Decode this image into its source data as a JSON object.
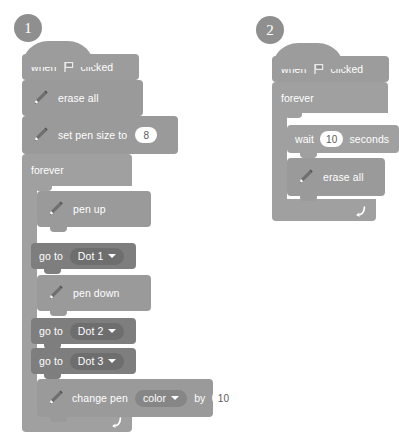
{
  "palette": {
    "events_block": "#9c9c9c",
    "control_block": "#a0a0a0",
    "pen_block": "#9a9a9a",
    "motion_block": "#7e7e7e",
    "dropdown_fill": "#6e6e6e",
    "input_fill": "#ffffff",
    "input_text": "#5a5a5a",
    "badge_fill": "#8f8f8f",
    "text": "#ffffff",
    "background": "#ffffff"
  },
  "scripts": [
    {
      "badge": "1",
      "blocks": {
        "when_flag_clicked": {
          "pre": "when",
          "icon": "green-flag-icon",
          "post": "clicked"
        },
        "erase_all": {
          "icon": "pen-icon",
          "label": "erase all"
        },
        "set_pen_size": {
          "icon": "pen-icon",
          "label": "set pen size to",
          "value": "8"
        },
        "forever": {
          "label": "forever",
          "icon": "loop-arrow-icon"
        },
        "pen_up": {
          "icon": "pen-icon",
          "label": "pen up"
        },
        "go_to_dot1": {
          "label": "go to",
          "dropdown": "Dot 1"
        },
        "pen_down": {
          "icon": "pen-icon",
          "label": "pen down"
        },
        "go_to_dot2": {
          "label": "go to",
          "dropdown": "Dot 2"
        },
        "go_to_dot3": {
          "label": "go to",
          "dropdown": "Dot 3"
        },
        "change_pen": {
          "icon": "pen-icon",
          "label": "change pen",
          "dropdown": "color",
          "by_label": "by",
          "value": "10"
        }
      }
    },
    {
      "badge": "2",
      "blocks": {
        "when_flag_clicked": {
          "pre": "when",
          "icon": "green-flag-icon",
          "post": "clicked"
        },
        "forever": {
          "label": "forever",
          "icon": "loop-arrow-icon"
        },
        "wait": {
          "pre": "wait",
          "value": "10",
          "post": "seconds"
        },
        "erase_all": {
          "icon": "pen-icon",
          "label": "erase all"
        }
      }
    }
  ]
}
